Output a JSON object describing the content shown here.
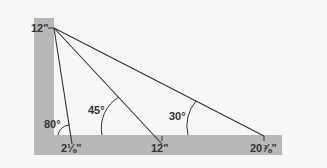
{
  "diagram": {
    "colors": {
      "square": "#b8b8b8",
      "background": "#f7f7f7",
      "line": "#333333",
      "text": "#333333"
    },
    "labels": {
      "tongue_mark": "12\"",
      "blade_mark_1": "2⅛\"",
      "blade_mark_2": "12\"",
      "blade_mark_3": "20⅞\"",
      "angle_1": "80°",
      "angle_2": "45°",
      "angle_3": "30°"
    }
  }
}
